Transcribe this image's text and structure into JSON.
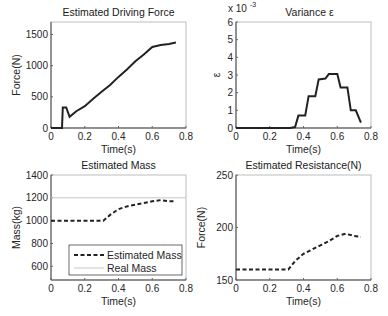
{
  "chart_data": [
    {
      "type": "line",
      "title": "Estimated Driving Force",
      "xlabel": "Time(s)",
      "ylabel": "Force(N)",
      "xlim": [
        0,
        0.8
      ],
      "ylim": [
        0,
        1700
      ],
      "xticks": [
        "0",
        "0.2",
        "0.4",
        "0.6",
        "0.8"
      ],
      "yticks": [
        "0",
        "500",
        "1000",
        "1500"
      ],
      "grid": false,
      "series": [
        {
          "name": "Driving Force",
          "style": "solid",
          "x": [
            0,
            0.02,
            0.065,
            0.07,
            0.09,
            0.11,
            0.15,
            0.2,
            0.25,
            0.3,
            0.35,
            0.4,
            0.45,
            0.5,
            0.55,
            0.6,
            0.65,
            0.7,
            0.74
          ],
          "y": [
            0,
            0,
            0,
            330,
            330,
            180,
            270,
            350,
            470,
            580,
            690,
            820,
            940,
            1070,
            1180,
            1300,
            1330,
            1345,
            1370
          ]
        }
      ]
    },
    {
      "type": "line",
      "title": "Variance ε",
      "xlabel": "Time(s)",
      "ylabel": "ε",
      "y_multiplier": "x 10^-3",
      "xlim": [
        0,
        0.8
      ],
      "ylim": [
        0,
        6
      ],
      "xticks": [
        "0",
        "0.2",
        "0.4",
        "0.6",
        "0.8"
      ],
      "yticks": [
        "0",
        "1",
        "2",
        "3",
        "4",
        "5",
        "6"
      ],
      "grid": false,
      "series": [
        {
          "name": "Variance",
          "style": "solid",
          "x": [
            0,
            0.32,
            0.35,
            0.37,
            0.41,
            0.43,
            0.47,
            0.49,
            0.53,
            0.55,
            0.6,
            0.62,
            0.66,
            0.68,
            0.71,
            0.74
          ],
          "y": [
            0,
            0,
            0.05,
            0.7,
            0.7,
            1.8,
            1.8,
            2.75,
            2.8,
            3.05,
            3.05,
            2.3,
            2.3,
            1.0,
            1.0,
            0.3
          ]
        }
      ]
    },
    {
      "type": "line",
      "title": "Estimated Mass",
      "xlabel": "Time(s)",
      "ylabel": "Mass(kg)",
      "xlim": [
        0,
        0.8
      ],
      "ylim": [
        480,
        1400
      ],
      "xticks": [
        "0",
        "0.2",
        "0.4",
        "0.6",
        "0.8"
      ],
      "yticks": [
        "600",
        "800",
        "1000",
        "1200",
        "1400"
      ],
      "grid": false,
      "legend": {
        "position": "lower right",
        "entries": [
          "Estimated Mass",
          "Real Mass"
        ]
      },
      "series": [
        {
          "name": "Estimated Mass",
          "style": "dashed",
          "x": [
            0,
            0.31,
            0.35,
            0.4,
            0.45,
            0.5,
            0.55,
            0.6,
            0.65,
            0.7,
            0.74
          ],
          "y": [
            1000,
            1000,
            1050,
            1100,
            1125,
            1140,
            1155,
            1170,
            1180,
            1170,
            1170
          ]
        },
        {
          "name": "Real Mass",
          "style": "solid-thin",
          "x": [
            0,
            0.8
          ],
          "y": [
            1200,
            1200
          ]
        }
      ]
    },
    {
      "type": "line",
      "title": "Estimated Resistance(N)",
      "xlabel": "Time(s)",
      "ylabel": "Force(N)",
      "xlim": [
        0,
        0.8
      ],
      "ylim": [
        150,
        250
      ],
      "xticks": [
        "0",
        "0.2",
        "0.4",
        "0.6",
        "0.8"
      ],
      "yticks": [
        "150",
        "200",
        "250"
      ],
      "grid": false,
      "series": [
        {
          "name": "Estimated Resistance",
          "style": "dashed",
          "x": [
            0,
            0.31,
            0.35,
            0.4,
            0.45,
            0.5,
            0.55,
            0.6,
            0.65,
            0.7,
            0.74
          ],
          "y": [
            160,
            160,
            168,
            175,
            179,
            183,
            187,
            192,
            194,
            192,
            191
          ]
        }
      ]
    }
  ]
}
